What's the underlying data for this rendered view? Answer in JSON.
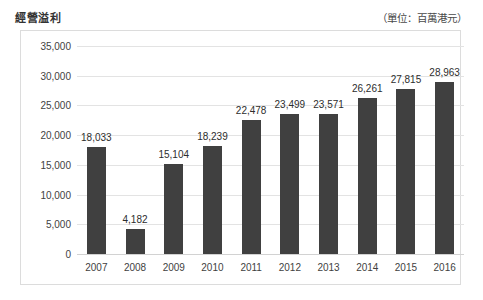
{
  "header": {
    "title": "經營溢利",
    "unit_note": "（單位：百萬港元）"
  },
  "chart_data": {
    "type": "bar",
    "title": "經營溢利",
    "subtitle": "（單位：百萬港元）",
    "xlabel": "",
    "ylabel": "",
    "categories": [
      "2007",
      "2008",
      "2009",
      "2010",
      "2011",
      "2012",
      "2013",
      "2014",
      "2015",
      "2016"
    ],
    "values": [
      18033,
      4182,
      15104,
      18239,
      22478,
      23499,
      23571,
      26261,
      27815,
      28963
    ],
    "value_labels": [
      "18,033",
      "4,182",
      "15,104",
      "18,239",
      "22,478",
      "23,499",
      "23,571",
      "26,261",
      "27,815",
      "28,963"
    ],
    "ylim": [
      0,
      35000
    ],
    "ytick_values": [
      0,
      5000,
      10000,
      15000,
      20000,
      25000,
      30000,
      35000
    ],
    "ytick_labels": [
      "0",
      "5,000",
      "10,000",
      "15,000",
      "20,000",
      "25,000",
      "30,000",
      "35,000"
    ],
    "grid": true,
    "legend": "none",
    "bar_color": "#404040",
    "grid_color": "#e3e3e3",
    "frame_color": "#dcdcdc",
    "text_color": "#3f3f3f"
  }
}
